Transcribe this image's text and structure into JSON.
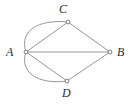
{
  "figure": {
    "kind": "undirected-multigraph-diagram",
    "width": 135,
    "height": 105,
    "background_color": "#ffffff",
    "edge_color": "#8a8a8a",
    "vertex_marker_color": "#6e6e6e",
    "label_color": "#2b2b2b"
  },
  "vertices": [
    {
      "id": "A",
      "label": "A",
      "x": 26,
      "y": 52
    },
    {
      "id": "B",
      "label": "B",
      "x": 110,
      "y": 52
    },
    {
      "id": "C",
      "label": "C",
      "x": 68,
      "y": 22
    },
    {
      "id": "D",
      "label": "D",
      "x": 67,
      "y": 81
    }
  ],
  "edges": [
    {
      "id": "A-C-straight",
      "from": "A",
      "to": "C",
      "style": "straight"
    },
    {
      "id": "A-C-curved",
      "from": "A",
      "to": "C",
      "style": "curved"
    },
    {
      "id": "A-B-straight",
      "from": "A",
      "to": "B",
      "style": "straight"
    },
    {
      "id": "A-D-straight",
      "from": "A",
      "to": "D",
      "style": "straight"
    },
    {
      "id": "A-D-curved",
      "from": "A",
      "to": "D",
      "style": "curved"
    },
    {
      "id": "C-B-straight",
      "from": "C",
      "to": "B",
      "style": "straight"
    },
    {
      "id": "D-B-straight",
      "from": "D",
      "to": "B",
      "style": "straight"
    }
  ],
  "paths": {
    "edge_A_C_straight": "M 26 52 L 68 22",
    "edge_A_C_curved": "M 26 52 C 19 31 38 19 68 22",
    "edge_A_B_straight": "M 26 52 L 110 52",
    "edge_A_D_straight": "M 26 52 L 67 81",
    "edge_A_D_curved": "M 26 52 C 19 72 38 85 67 81",
    "edge_C_B_straight": "M 68 22 L 110 52",
    "edge_D_B_straight": "M 67 81 L 110 52"
  }
}
